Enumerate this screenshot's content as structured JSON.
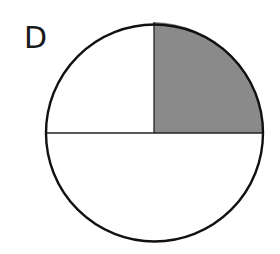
{
  "figure": {
    "label": "D",
    "shape": "circle",
    "divisions": 3,
    "regions": [
      {
        "name": "top-left-quarter",
        "fraction": "1/4",
        "shaded": false
      },
      {
        "name": "top-right-quarter",
        "fraction": "1/4",
        "shaded": true
      },
      {
        "name": "bottom-half",
        "fraction": "1/2",
        "shaded": false
      }
    ],
    "shaded_fraction": "1/4",
    "colors": {
      "outline": "#111111",
      "shade": "#8a8a8a",
      "background": "#ffffff"
    }
  }
}
